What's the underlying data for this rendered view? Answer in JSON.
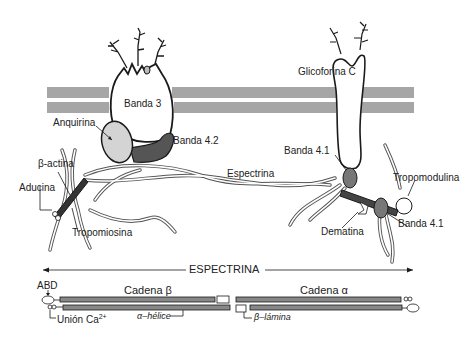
{
  "figure": {
    "type": "diagram",
    "colors": {
      "membrane": "#a6a6a6",
      "ankyrin": "#d4d4d4",
      "band42": "#555555",
      "outline": "#1a1a1a",
      "background": "#ffffff"
    }
  },
  "labels": {
    "banda3": "Banda 3",
    "anquirina": "Anquirina",
    "banda42": "Banda 4.2",
    "glicoforina_c": "Glicoforina C",
    "banda41_top": "Banda 4.1",
    "espectrina": "Espectrina",
    "beta_actina": "β-actina",
    "aducina": "Aducina",
    "tropomiosina": "Tropomiosina",
    "tropomodulina": "Tropomodulina",
    "dematina": "Dematina",
    "banda41_bottom": "Banda 4.1"
  },
  "spectrin_schematic": {
    "title": "ESPECTRINA",
    "abd": "ABD",
    "cadena_beta": "Cadena β",
    "cadena_alpha": "Cadena α",
    "union_ca": "Unión Ca",
    "union_ca_sup": "2+",
    "alpha_helice": "α–hélice",
    "beta_lamina": "β–lámina"
  }
}
